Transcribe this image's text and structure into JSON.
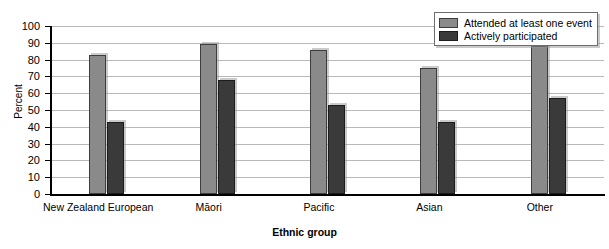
{
  "chart_data": {
    "type": "bar",
    "title": "",
    "subtitle": "",
    "xlabel": "Ethnic group",
    "ylabel": "Percent",
    "ylim": [
      0,
      100
    ],
    "yticks": [
      0,
      10,
      20,
      30,
      40,
      50,
      60,
      70,
      80,
      90,
      100
    ],
    "grid": true,
    "legend_position": "top-right",
    "categories": [
      "New Zealand European",
      "Māori",
      "Pacific",
      "Asian",
      "Other"
    ],
    "series": [
      {
        "name": "Attended at least one event",
        "color": "#8a8a8a",
        "values": [
          83,
          89,
          86,
          75,
          88
        ]
      },
      {
        "name": "Actively participated",
        "color": "#3a3a3a",
        "values": [
          43,
          68,
          53,
          43,
          57
        ]
      }
    ]
  },
  "axes": {
    "y_title": "Percent",
    "x_title": "Ethnic group"
  },
  "legend": {
    "items": [
      {
        "label": "Attended at least one event",
        "swatch": "#8a8a8a"
      },
      {
        "label": "Actively participated",
        "swatch": "#3a3a3a"
      }
    ]
  }
}
